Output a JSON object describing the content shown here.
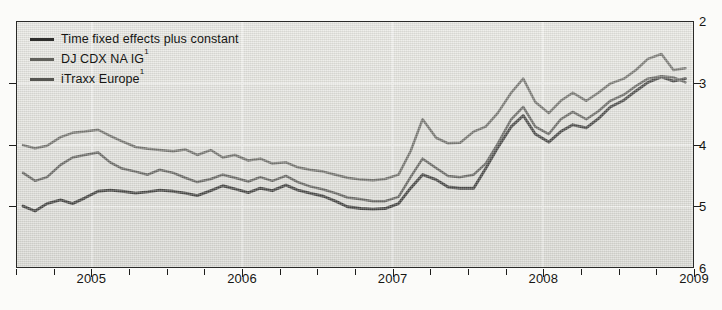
{
  "legend": {
    "position": "top-left",
    "items": [
      {
        "label": "Time fixed effects plus constant",
        "color": "#2e2e2c",
        "sup": ""
      },
      {
        "label": "DJ CDX NA IG",
        "color": "#61615c",
        "sup": "1"
      },
      {
        "label": "iTraxx Europe",
        "color": "#555551",
        "sup": "1"
      }
    ]
  },
  "axes": {
    "y_ticks": [
      "6",
      "5",
      "4",
      "3",
      "2"
    ],
    "x_ticks": [
      "2005",
      "2006",
      "2007",
      "2008",
      "2009"
    ]
  },
  "chart_data": {
    "type": "line",
    "title": "",
    "subtitle": "",
    "xlabel": "",
    "ylabel": "",
    "xlim": [
      2004.5,
      2009.0
    ],
    "ylim": [
      2,
      6
    ],
    "y_ticks": [
      2,
      3,
      4,
      5,
      6
    ],
    "x_ticks": [
      2005,
      2006,
      2007,
      2008,
      2009
    ],
    "x_tick_labels": [
      "2005",
      "2006",
      "2007",
      "2008",
      "2009"
    ],
    "grid": "both-light",
    "legend_position": "top-left",
    "y_axis_side": "right",
    "x": [
      2004.54,
      2004.62,
      2004.7,
      2004.79,
      2004.87,
      2004.95,
      2005.04,
      2005.12,
      2005.2,
      2005.29,
      2005.37,
      2005.45,
      2005.54,
      2005.62,
      2005.7,
      2005.79,
      2005.87,
      2005.95,
      2006.04,
      2006.12,
      2006.2,
      2006.29,
      2006.37,
      2006.45,
      2006.54,
      2006.62,
      2006.7,
      2006.79,
      2006.87,
      2006.95,
      2007.04,
      2007.12,
      2007.2,
      2007.29,
      2007.37,
      2007.45,
      2007.54,
      2007.62,
      2007.7,
      2007.79,
      2007.87,
      2007.95,
      2008.04,
      2008.12,
      2008.2,
      2008.29,
      2008.37,
      2008.45,
      2008.54,
      2008.62,
      2008.7,
      2008.79,
      2008.87,
      2008.95
    ],
    "series": [
      {
        "name": "Time fixed effects plus constant",
        "color": "#2e2e2c",
        "values": [
          3.01,
          2.93,
          3.05,
          3.11,
          3.05,
          3.14,
          3.25,
          3.27,
          3.25,
          3.22,
          3.24,
          3.27,
          3.25,
          3.22,
          3.18,
          3.26,
          3.34,
          3.29,
          3.23,
          3.3,
          3.26,
          3.35,
          3.27,
          3.22,
          3.17,
          3.09,
          3.0,
          2.97,
          2.96,
          2.97,
          3.05,
          3.3,
          3.52,
          3.44,
          3.32,
          3.3,
          3.3,
          3.62,
          3.96,
          4.3,
          4.48,
          4.18,
          4.05,
          4.22,
          4.33,
          4.28,
          4.43,
          4.62,
          4.73,
          4.88,
          5.02,
          5.11,
          5.04,
          5.08
        ]
      },
      {
        "name": "DJ CDX NA IG",
        "color": "#61615c",
        "values": [
          4.0,
          3.95,
          3.99,
          4.13,
          4.2,
          4.22,
          4.25,
          4.15,
          4.06,
          3.97,
          3.94,
          3.92,
          3.9,
          3.93,
          3.84,
          3.92,
          3.8,
          3.84,
          3.75,
          3.78,
          3.7,
          3.72,
          3.64,
          3.6,
          3.57,
          3.52,
          3.47,
          3.44,
          3.43,
          3.45,
          3.52,
          3.9,
          4.42,
          4.12,
          4.03,
          4.04,
          4.22,
          4.3,
          4.52,
          4.85,
          5.08,
          4.7,
          4.52,
          4.72,
          4.85,
          4.72,
          4.85,
          5.0,
          5.08,
          5.22,
          5.4,
          5.48,
          5.22,
          5.25
        ]
      },
      {
        "name": "iTraxx Europe",
        "color": "#555551",
        "values": [
          3.55,
          3.42,
          3.48,
          3.68,
          3.8,
          3.84,
          3.88,
          3.72,
          3.62,
          3.57,
          3.52,
          3.6,
          3.55,
          3.47,
          3.4,
          3.45,
          3.52,
          3.47,
          3.41,
          3.48,
          3.42,
          3.5,
          3.4,
          3.33,
          3.28,
          3.22,
          3.15,
          3.12,
          3.09,
          3.09,
          3.16,
          3.48,
          3.78,
          3.63,
          3.5,
          3.48,
          3.52,
          3.7,
          4.02,
          4.42,
          4.62,
          4.3,
          4.18,
          4.42,
          4.54,
          4.42,
          4.55,
          4.72,
          4.82,
          4.96,
          5.08,
          5.12,
          5.1,
          5.02
        ]
      }
    ]
  }
}
